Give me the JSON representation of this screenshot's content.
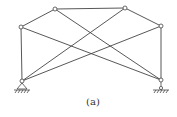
{
  "diagram": {
    "caption": "(a)",
    "stroke_color": "#444444",
    "nodes": [
      {
        "id": "A",
        "x": 22,
        "y": 81,
        "support": "pin"
      },
      {
        "id": "B",
        "x": 21,
        "y": 27
      },
      {
        "id": "C",
        "x": 55,
        "y": 9
      },
      {
        "id": "D",
        "x": 125,
        "y": 8
      },
      {
        "id": "E",
        "x": 161,
        "y": 26
      },
      {
        "id": "F",
        "x": 161,
        "y": 80,
        "support": "roller"
      }
    ],
    "members": [
      [
        "A",
        "B"
      ],
      [
        "B",
        "C"
      ],
      [
        "C",
        "D"
      ],
      [
        "D",
        "E"
      ],
      [
        "E",
        "F"
      ],
      [
        "A",
        "D"
      ],
      [
        "A",
        "E"
      ],
      [
        "B",
        "F"
      ],
      [
        "C",
        "F"
      ]
    ]
  }
}
